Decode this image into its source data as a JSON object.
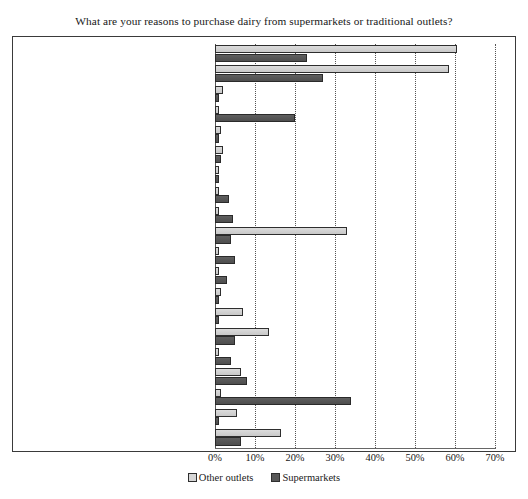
{
  "chart_data": {
    "type": "bar",
    "orientation": "horizontal",
    "title": "What are your reasons to purchase dairy from supermarkets or traditional outlets?",
    "xlabel": "",
    "ylabel": "",
    "xlim": [
      0,
      70
    ],
    "xtick_labels": [
      "0%",
      "10%",
      "20%",
      "30%",
      "40%",
      "50%",
      "60%",
      "70%"
    ],
    "xtick_values": [
      0,
      10,
      20,
      30,
      40,
      50,
      60,
      70
    ],
    "grid": "vertical-dotted",
    "legend_position": "bottom-center",
    "categories": [
      "Buying culture & habits",
      "Lack of info about alternative outlets",
      "Credit facilities",
      "Cleanliness",
      "Spaciousness",
      "Friendly service",
      "Secure environment",
      "Parking facilities",
      "Nice environment",
      "Easy to shop from home",
      "Easy to shop from work",
      "Small packs",
      "Purchase in bulk",
      "Variety/assortment",
      "Taste",
      "Packaging",
      "Freshness",
      "Hygiene",
      "Nutritional value",
      "Price"
    ],
    "series": [
      {
        "name": "Other outlets",
        "color": "#d4d4d4",
        "values": [
          60.5,
          58.5,
          2.0,
          0.5,
          1.5,
          2.0,
          1.0,
          0.7,
          0.7,
          33.0,
          0.5,
          0.7,
          1.5,
          7.0,
          13.5,
          0.7,
          6.5,
          1.5,
          5.5,
          16.5
        ]
      },
      {
        "name": "Supermarkets",
        "color": "#575757",
        "values": [
          23.0,
          27.0,
          1.0,
          20.0,
          0.5,
          1.5,
          0.7,
          3.5,
          4.5,
          4.0,
          5.0,
          3.0,
          0.5,
          0.7,
          5.0,
          4.0,
          8.0,
          34.0,
          0.7,
          6.5
        ]
      }
    ]
  },
  "legend": [
    {
      "label": "Other outlets",
      "swatch": "other"
    },
    {
      "label": "Supermarkets",
      "swatch": "super"
    }
  ]
}
